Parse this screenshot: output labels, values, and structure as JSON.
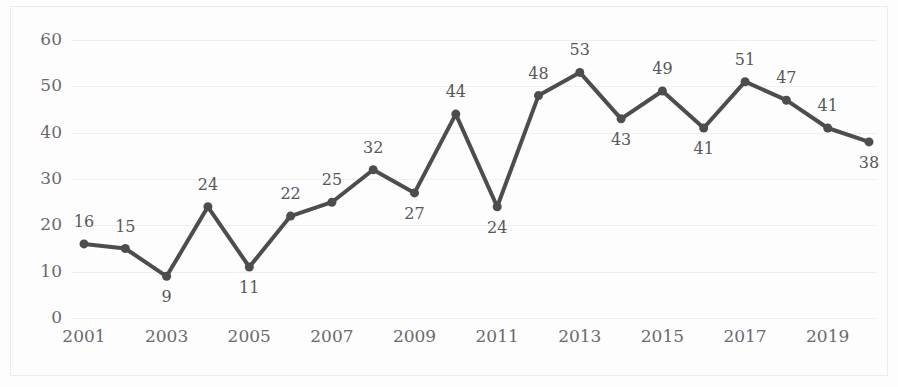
{
  "chart_data": {
    "type": "line",
    "title": "",
    "xlabel": "",
    "ylabel": "",
    "x": [
      2001,
      2002,
      2003,
      2004,
      2005,
      2006,
      2007,
      2008,
      2009,
      2010,
      2011,
      2012,
      2013,
      2014,
      2015,
      2016,
      2017,
      2018,
      2019,
      2020
    ],
    "values": [
      16,
      15,
      9,
      24,
      11,
      22,
      25,
      32,
      27,
      44,
      24,
      48,
      53,
      43,
      49,
      41,
      51,
      47,
      41,
      38
    ],
    "point_labels": [
      "16",
      "15",
      "9",
      "24",
      "11",
      "22",
      "25",
      "32",
      "27",
      "44",
      "24",
      "48",
      "53",
      "43",
      "49",
      "41",
      "51",
      "47",
      "41",
      "38"
    ],
    "label_positions": [
      "above",
      "above",
      "below",
      "above",
      "below",
      "above",
      "above",
      "above",
      "below",
      "above",
      "below",
      "above",
      "above",
      "below",
      "above",
      "below",
      "above",
      "above",
      "above",
      "below"
    ],
    "ylim": [
      0,
      60
    ],
    "yticks": [
      0,
      10,
      20,
      30,
      40,
      50,
      60
    ],
    "ytick_labels": [
      "0",
      "10",
      "20",
      "30",
      "40",
      "50",
      "60"
    ],
    "xticks": [
      2001,
      2003,
      2005,
      2007,
      2009,
      2011,
      2013,
      2015,
      2017,
      2019
    ],
    "xtick_labels": [
      "2001",
      "2003",
      "2005",
      "2007",
      "2009",
      "2011",
      "2013",
      "2015",
      "2017",
      "2019"
    ],
    "grid": true,
    "legend": "none",
    "series_color": "#4d4d50",
    "marker": "circle",
    "marker_size": 9,
    "line_width": 4,
    "gridline_color": "#eeeeef",
    "axis_text_color": "#6a6a6d",
    "label_text_color": "#58585b",
    "background_color": "#fdfdfd"
  }
}
